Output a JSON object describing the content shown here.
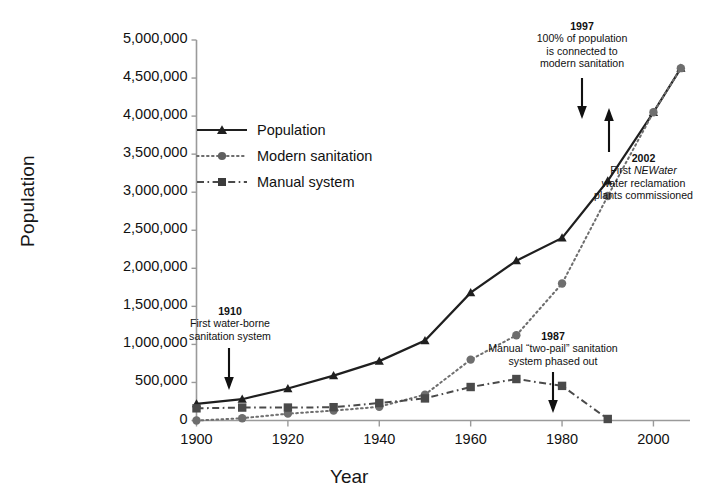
{
  "chart_data": {
    "type": "line",
    "title": "",
    "xlabel": "Year",
    "ylabel": "Population",
    "xlim": [
      1900,
      2008
    ],
    "ylim": [
      0,
      5000000
    ],
    "grid": false,
    "legend_position": "upper-left-inside",
    "x_ticks": [
      "1900",
      "1920",
      "1940",
      "1960",
      "1980",
      "2000"
    ],
    "x_tick_values": [
      1900,
      1920,
      1940,
      1960,
      1980,
      2000
    ],
    "y_ticks": [
      "0",
      "500,000",
      "1,000,000",
      "1,500,000",
      "2,000,000",
      "2,500,000",
      "3,000,000",
      "3,500,000",
      "4,000,000",
      "4,500,000",
      "5,000,000"
    ],
    "y_tick_values": [
      0,
      500000,
      1000000,
      1500000,
      2000000,
      2500000,
      3000000,
      3500000,
      4000000,
      4500000,
      5000000
    ],
    "series": [
      {
        "name": "Population",
        "marker": "triangle",
        "line_style": "solid",
        "color": "#1f1f1f",
        "x": [
          1900,
          1910,
          1920,
          1930,
          1940,
          1950,
          1960,
          1970,
          1980,
          1990,
          2000,
          2006
        ],
        "values": [
          220000,
          280000,
          420000,
          590000,
          780000,
          1050000,
          1680000,
          2100000,
          2400000,
          3150000,
          4050000,
          4630000
        ]
      },
      {
        "name": "Modern sanitation",
        "marker": "circle",
        "line_style": "dotted",
        "color": "#6e6e6e",
        "x": [
          1900,
          1910,
          1920,
          1930,
          1940,
          1950,
          1960,
          1970,
          1980,
          1990,
          2000,
          2006
        ],
        "values": [
          0,
          30000,
          90000,
          130000,
          180000,
          340000,
          800000,
          1120000,
          1800000,
          2950000,
          4050000,
          4630000
        ]
      },
      {
        "name": "Manual system",
        "marker": "square",
        "line_style": "dash-dot",
        "color": "#4a4a4a",
        "x": [
          1900,
          1910,
          1920,
          1930,
          1940,
          1950,
          1960,
          1970,
          1980,
          1990
        ],
        "values": [
          160000,
          170000,
          170000,
          175000,
          230000,
          290000,
          440000,
          545000,
          455000,
          20000
        ]
      }
    ],
    "annotations": [
      {
        "id": "annot-1910",
        "year": "1910",
        "lines": [
          "First water-borne",
          "sanitation system"
        ],
        "arrow": "down"
      },
      {
        "id": "annot-1997",
        "year": "1997",
        "lines": [
          "100% of population",
          "is connected to",
          "modern sanitation"
        ],
        "arrow": "down"
      },
      {
        "id": "annot-2002",
        "year": "2002",
        "lines": [
          "First NEWater",
          "water reclamation",
          "plants commissioned"
        ],
        "italic_word": "NEWater",
        "arrow": "up"
      },
      {
        "id": "annot-1987",
        "year": "1987",
        "lines": [
          "Manual \"two-pail\" sanitation",
          "system phased out"
        ],
        "arrow": "down"
      }
    ]
  },
  "legend": {
    "items": [
      {
        "label": "Population"
      },
      {
        "label": "Modern sanitation"
      },
      {
        "label": "Manual system"
      }
    ]
  },
  "axes": {
    "y_title": "Population",
    "x_title": "Year"
  },
  "annot_1910": {
    "year": "1910",
    "line1": "First water-borne",
    "line2": "sanitation system"
  },
  "annot_1997": {
    "year": "1997",
    "line1": "100% of population",
    "line2": "is connected to",
    "line3": "modern sanitation"
  },
  "annot_2002": {
    "year": "2002",
    "line1_pre": "First ",
    "line1_italic": "NEWater",
    "line2": "water reclamation",
    "line3": "plants commissioned"
  },
  "annot_1987": {
    "year": "1987",
    "line1": "Manual “two-pail” sanitation",
    "line2": "system phased out"
  }
}
